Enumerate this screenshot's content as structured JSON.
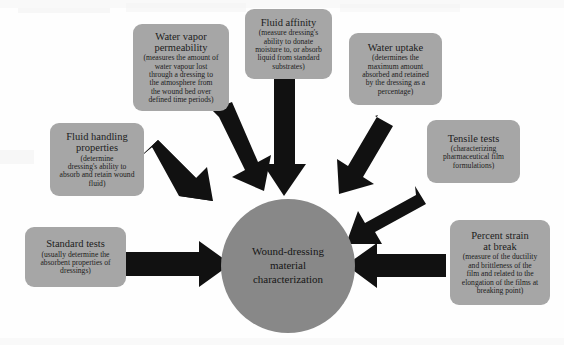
{
  "diagram": {
    "type": "hub-and-spoke",
    "center": {
      "label": "Wound-dressing\nmaterial\ncharacterization",
      "color": "#888888"
    },
    "node_color": "#a6a6a6",
    "arrow_color": "#111111",
    "background": "#ffffff",
    "nodes": [
      {
        "id": "fluid-handling-properties",
        "title": "Fluid handling\nproperties",
        "desc": "(determine\ndressing's ability to\nabsorb and retain wound\nfluid)",
        "arrow": "diagonal down-right"
      },
      {
        "id": "water-vapor-permeability",
        "title": "Water vapor\npermeability",
        "desc": "(measures the amount of\nwater vapour lost\nthrough a dressing to\nthe atmosphere from\nthe wound bed over\ndefined time periods)",
        "arrow": "diagonal down-right"
      },
      {
        "id": "fluid-affinity",
        "title": "Fluid affinity",
        "desc": "(measure dressing's\nability to donate\nmoisture to, or absorb\nliquid from standard\nsubstrates)",
        "arrow": "straight down"
      },
      {
        "id": "water-uptake",
        "title": "Water uptake",
        "desc": "(determines the\nmaximum amount\nabsorbed and retained\nby the dressing as a\npercentage)",
        "arrow": "diagonal down-left"
      },
      {
        "id": "tensile-tests",
        "title": "Tensile tests",
        "desc": "(characterizing\npharmaceutical film\nformulations)",
        "arrow": "diagonal down-left"
      },
      {
        "id": "standard-tests",
        "title": "Standard tests",
        "desc": "(usually determine the\nabsorbent properties of\ndressings)",
        "arrow": "straight right"
      },
      {
        "id": "percent-strain-at-break",
        "title": "Percent strain\nat break",
        "desc": "(measure of the ductility\nand brittleness of the\nfilm and related to the\nelongation of the films at\nbreaking point)",
        "arrow": "straight left"
      }
    ]
  }
}
